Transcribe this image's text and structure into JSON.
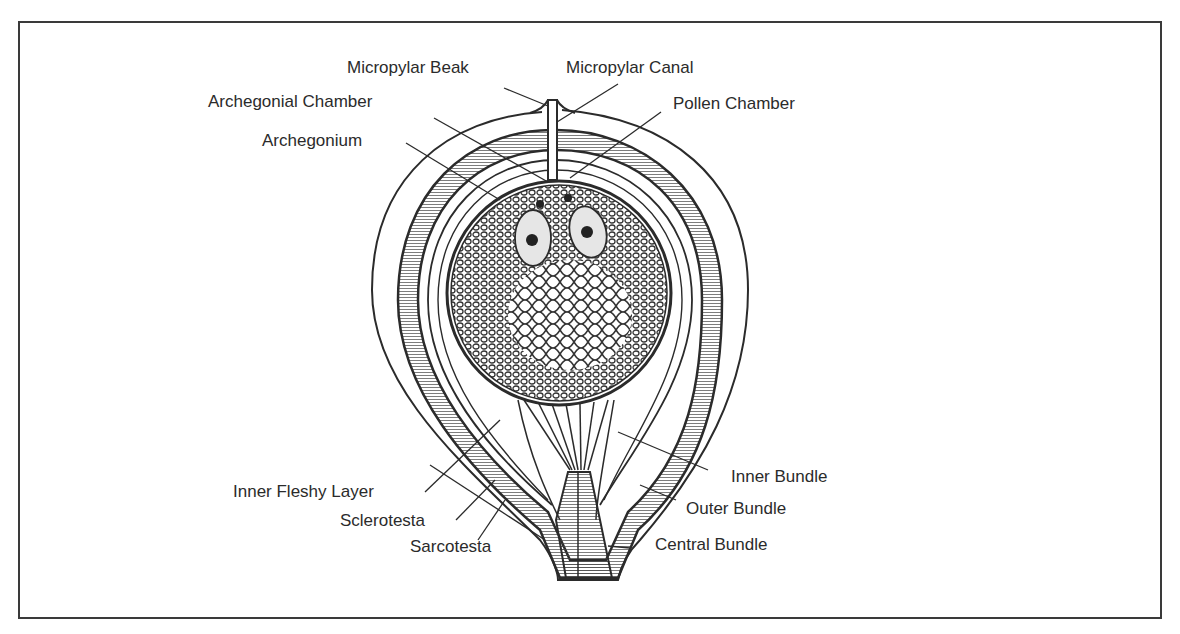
{
  "figure": {
    "colors": {
      "ink": "#2b2b2b",
      "frame": "#3a3a3a",
      "paper": "#ffffff",
      "hatch": "#555555"
    },
    "labels": {
      "micropylar_beak": "Micropylar Beak",
      "micropylar_canal": "Micropylar Canal",
      "archegonial_chamber": "Archegonial Chamber",
      "pollen_chamber": "Pollen Chamber",
      "archegonium": "Archegonium",
      "inner_fleshy_layer": "Inner Fleshy Layer",
      "sclerotesta": "Sclerotesta",
      "sarcotesta": "Sarcotesta",
      "inner_bundle": "Inner Bundle",
      "outer_bundle": "Outer Bundle",
      "central_bundle": "Central Bundle"
    }
  }
}
